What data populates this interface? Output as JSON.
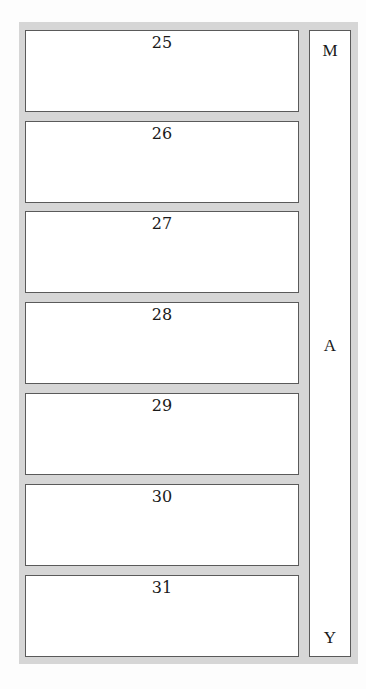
{
  "calendar": {
    "month_letters": {
      "top": "M",
      "middle": "A",
      "bottom": "Y"
    },
    "days": [
      {
        "label": "25"
      },
      {
        "label": "26"
      },
      {
        "label": "27"
      },
      {
        "label": "28"
      },
      {
        "label": "29"
      },
      {
        "label": "30"
      },
      {
        "label": "31"
      }
    ],
    "colors": {
      "frame": "#d6d6d6",
      "box_fill": "#ffffff",
      "box_border": "#5a5a5a",
      "text": "#1a1a1a"
    }
  }
}
